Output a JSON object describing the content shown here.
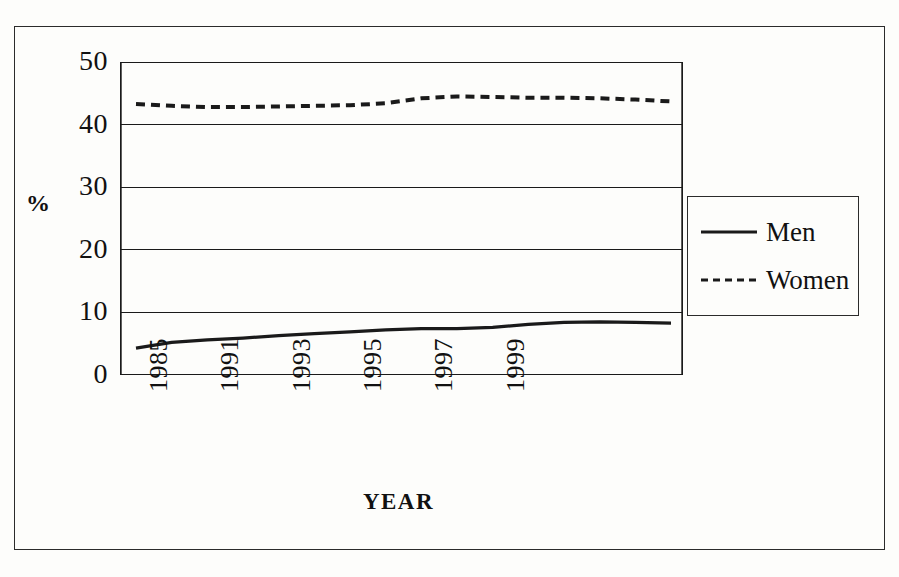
{
  "figure": {
    "background_color": "#fdfdfb",
    "ink_color": "#1a1a1a"
  },
  "chart_data": {
    "type": "line",
    "title": "",
    "subtitle": "",
    "xlabel": "YEAR",
    "ylabel": "%",
    "ylim": [
      0,
      50
    ],
    "yticks": [
      0,
      10,
      20,
      30,
      40,
      50
    ],
    "ytick_labels": [
      "0",
      "10",
      "20",
      "30",
      "40",
      "50"
    ],
    "grid": true,
    "grid_axis": "y",
    "legend_position": "right-outside",
    "x": [
      1985,
      1986,
      1987,
      1988,
      1989,
      1990,
      1991,
      1992,
      1993,
      1994,
      1995,
      1996,
      1997,
      1998,
      1999,
      2000
    ],
    "xtick_labels": [
      "1985",
      "",
      "1991",
      "",
      "1993",
      "",
      "1995",
      "",
      "1997",
      "",
      "1999",
      "",
      "",
      "",
      "",
      ""
    ],
    "xtick_labels_shown": [
      "1985",
      "1991",
      "1993",
      "1995",
      "1997",
      "1999"
    ],
    "xtick_label_rotation": 90,
    "series": [
      {
        "name": "Men",
        "line_style": "solid",
        "color": "#1a1a1a",
        "values": [
          4.3,
          5.2,
          5.6,
          5.9,
          6.3,
          6.6,
          6.9,
          7.2,
          7.4,
          7.4,
          7.6,
          8.1,
          8.4,
          8.5,
          8.4,
          8.3
        ]
      },
      {
        "name": "Women",
        "line_style": "dashed",
        "color": "#1a1a1a",
        "values": [
          43.3,
          43.0,
          42.8,
          42.8,
          42.9,
          43.0,
          43.1,
          43.4,
          44.2,
          44.5,
          44.4,
          44.3,
          44.3,
          44.2,
          44.0,
          43.7
        ]
      }
    ]
  },
  "legend": {
    "entries": [
      {
        "label": "Men",
        "style": "solid"
      },
      {
        "label": "Women",
        "style": "dashed"
      }
    ]
  }
}
